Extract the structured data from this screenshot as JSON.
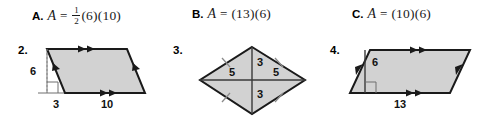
{
  "choices": [
    {
      "id": "a",
      "letter": "A.",
      "variable": "A",
      "equals": "=",
      "has_fraction": true,
      "numerator": "1",
      "denominator": "2",
      "expression": "(6)(10)",
      "full_text": "A. A = 1/2(6)(10)"
    },
    {
      "id": "b",
      "letter": "B.",
      "variable": "A",
      "equals": "=",
      "has_fraction": false,
      "expression": "(13)(6)",
      "full_text": "B. A = (13)(6)"
    },
    {
      "id": "c",
      "letter": "C.",
      "variable": "A",
      "equals": "=",
      "has_fraction": false,
      "expression": "(10)(6)",
      "full_text": "C. A = (10)(6)"
    }
  ],
  "figures": [
    {
      "id": "fig2",
      "number": "2.",
      "shape": "parallelogram",
      "fill_color": "#d2d2d2",
      "labels": {
        "height": "6",
        "offset": "3",
        "base": "10"
      },
      "marks": {
        "top_arrows": 2,
        "bottom_arrows": 2,
        "side_arrows": 1
      },
      "right_angle_marker": true,
      "height_line_style": "dashed"
    },
    {
      "id": "fig3",
      "number": "3.",
      "shape": "rhombus",
      "fill_color": "#d2d2d2",
      "labels": {
        "left": "5",
        "top_middle": "3",
        "right": "5",
        "bottom_middle": "3"
      },
      "marks": {
        "side_ticks": 4,
        "diagonals": 2
      },
      "right_angle_marker": false
    },
    {
      "id": "fig4",
      "number": "4.",
      "shape": "parallelogram",
      "fill_color": "#d2d2d2",
      "labels": {
        "height": "6",
        "base": "13"
      },
      "marks": {
        "top_arrows": 2,
        "bottom_arrows": 2,
        "side_arrows": 1
      },
      "right_angle_marker": true,
      "height_line_style": "solid"
    }
  ]
}
